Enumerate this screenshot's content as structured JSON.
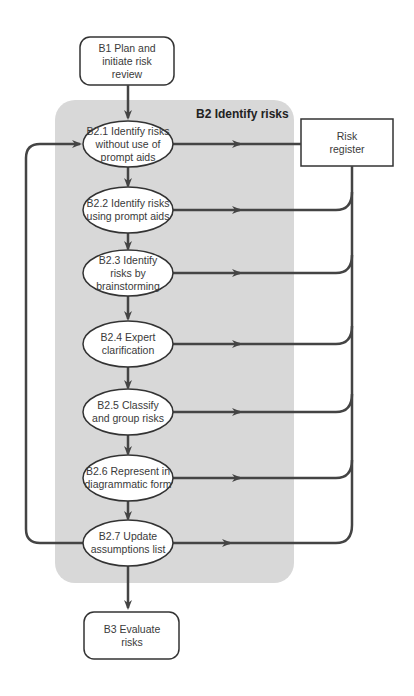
{
  "diagram": {
    "group": {
      "title": "B2 Identify risks",
      "fill": "#d8d8d8"
    },
    "start": {
      "label": "B1 Plan and initiate risk review"
    },
    "end": {
      "label": "B3 Evaluate risks"
    },
    "register": {
      "label": "Risk register"
    },
    "steps": [
      {
        "id": "B2.1",
        "label": "B2.1 Identify risks without use of prompt aids"
      },
      {
        "id": "B2.2",
        "label": "B2.2 Identify risks using prompt aids"
      },
      {
        "id": "B2.3",
        "label": "B2.3 Identify risks by brainstorming"
      },
      {
        "id": "B2.4",
        "label": "B2.4 Expert clarification"
      },
      {
        "id": "B2.5",
        "label": "B2.5 Classify and group risks"
      },
      {
        "id": "B2.6",
        "label": "B2.6 Represent in diagrammatic form"
      },
      {
        "id": "B2.7",
        "label": "B2.7 Update assumptions list"
      }
    ],
    "colors": {
      "line": "#444444",
      "node_fill": "#ffffff",
      "node_stroke": "#333333"
    }
  }
}
